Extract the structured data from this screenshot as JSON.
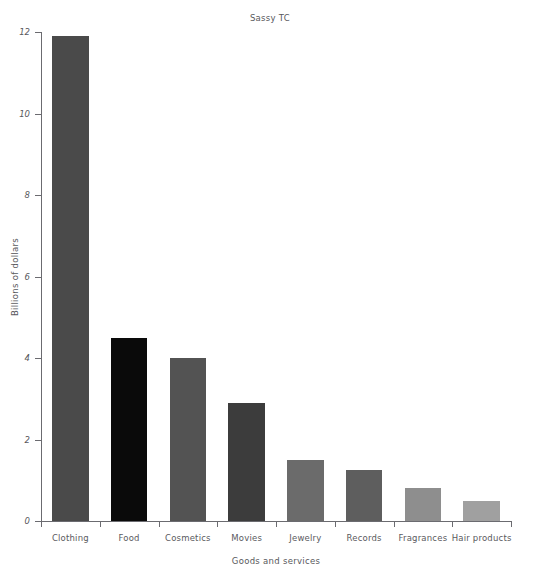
{
  "chart_data": {
    "type": "bar",
    "title": "Sassy TC",
    "xlabel": "Goods and services",
    "ylabel": "Billions of dollars",
    "categories": [
      "Clothing",
      "Food",
      "Cosmetics",
      "Movies",
      "Jewelry",
      "Records",
      "Fragrances",
      "Hair products"
    ],
    "values": [
      11.9,
      4.5,
      4.0,
      2.9,
      1.5,
      1.25,
      0.8,
      0.5
    ],
    "bar_colors": [
      "#4a4a4a",
      "#0a0a0a",
      "#535353",
      "#3c3c3c",
      "#6b6b6b",
      "#5e5e5e",
      "#8e8e8e",
      "#a0a0a0"
    ],
    "ylim": [
      0,
      12
    ],
    "yticks": [
      0,
      2,
      4,
      6,
      8,
      10,
      12
    ],
    "ytick_labels": [
      "0",
      "2",
      "4",
      "6",
      "8",
      "10",
      "12"
    ],
    "grid": false,
    "legend": "none",
    "axis_color": "#6b6b70",
    "text_color": "#58585c",
    "background": "#ffffff"
  }
}
